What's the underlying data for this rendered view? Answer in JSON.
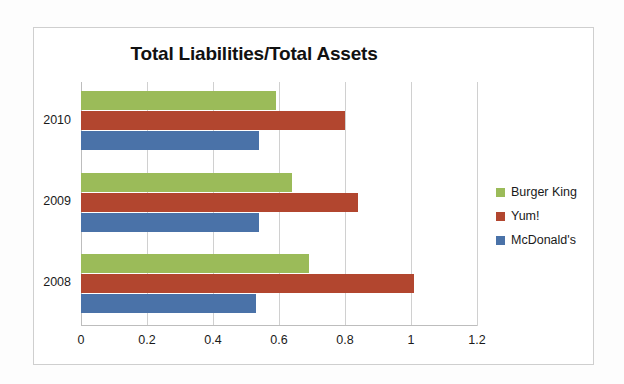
{
  "chart_data": {
    "type": "bar",
    "orientation": "horizontal",
    "title": "Total Liabilities/Total Assets",
    "xlabel": "",
    "ylabel": "",
    "categories": [
      "2010",
      "2009",
      "2008"
    ],
    "series": [
      {
        "name": "Burger King",
        "color": "#9bbb59",
        "values": [
          0.59,
          0.64,
          0.69
        ]
      },
      {
        "name": "Yum!",
        "color": "#b2462f",
        "values": [
          0.8,
          0.84,
          1.01
        ]
      },
      {
        "name": "McDonald's",
        "color": "#4a72a8",
        "values": [
          0.54,
          0.54,
          0.53
        ]
      }
    ],
    "xlim": [
      0,
      1.2
    ],
    "xticks": [
      "0",
      "0.2",
      "0.4",
      "0.6",
      "0.8",
      "1",
      "1.2"
    ],
    "xtick_values": [
      0,
      0.2,
      0.4,
      0.6,
      0.8,
      1,
      1.2
    ],
    "grid": "vertical",
    "legend_position": "right"
  },
  "legend": {
    "items": [
      {
        "label": "Burger King"
      },
      {
        "label": "Yum!"
      },
      {
        "label": "McDonald's"
      }
    ]
  }
}
